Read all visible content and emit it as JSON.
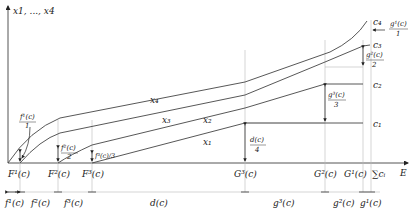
{
  "diagram": {
    "y_axis_label": "x1, ..., x4",
    "x_axis_label": "E",
    "curves": [
      {
        "name": "x4",
        "label": "x₄"
      },
      {
        "name": "x3",
        "label": "x₃"
      },
      {
        "name": "x2",
        "label": "x₂"
      },
      {
        "name": "x1",
        "label": "x₁"
      }
    ],
    "levels": [
      {
        "name": "c4",
        "label": "c₄"
      },
      {
        "name": "c3",
        "label": "c₃"
      },
      {
        "name": "c2",
        "label": "c₂"
      },
      {
        "name": "c1",
        "label": "c₁"
      }
    ],
    "x_ticks": [
      {
        "name": "F1",
        "label": "F¹(c)"
      },
      {
        "name": "F2",
        "label": "F²(c)"
      },
      {
        "name": "F3",
        "label": "F³(c)"
      },
      {
        "name": "G3",
        "label": "G³(c)"
      },
      {
        "name": "G2",
        "label": "G²(c)"
      },
      {
        "name": "G1",
        "label": "G¹(c)"
      },
      {
        "name": "sum",
        "label": "∑cᵢ"
      }
    ],
    "intervals": [
      {
        "name": "f1",
        "label": "f¹(c)"
      },
      {
        "name": "f2",
        "label": "f²(c)"
      },
      {
        "name": "f3",
        "label": "f³(c)"
      },
      {
        "name": "d",
        "label": "d(c)"
      },
      {
        "name": "g3",
        "label": "g³(c)"
      },
      {
        "name": "g2",
        "label": "g²(c)"
      },
      {
        "name": "g1",
        "label": "g¹(c)"
      }
    ],
    "annotations": {
      "f1_num": "f¹(c)",
      "f1_den": "1",
      "f2_num": "f²(c)",
      "f2_den": "2",
      "f3": "f³(c)/3",
      "d_num": "d(c)",
      "d_den": "4",
      "g3_num": "g³(c)",
      "g3_den": "3",
      "g2_num": "g²(c)",
      "g2_den": "2",
      "g1_num": "g¹(c)",
      "g1_den": "1"
    }
  }
}
